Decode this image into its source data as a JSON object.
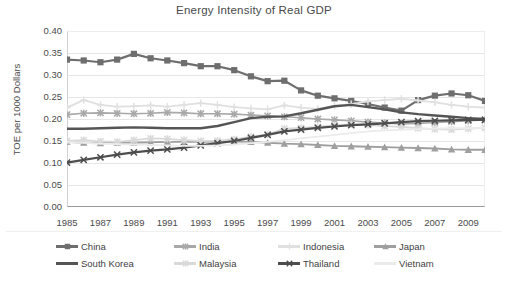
{
  "chart_data": {
    "type": "line",
    "title": "Energy Intensity of Real GDP",
    "xlabel": "",
    "ylabel": "TOE per 1000 Dollars",
    "ylim": [
      0.0,
      0.4
    ],
    "ytick_step": 0.05,
    "yticks": [
      "0.40",
      "0.35",
      "0.30",
      "0.25",
      "0.20",
      "0.15",
      "0.10",
      "0.05",
      "0.00"
    ],
    "grid": true,
    "legend_position": "bottom",
    "x": [
      1985,
      1986,
      1987,
      1988,
      1989,
      1990,
      1991,
      1992,
      1993,
      1994,
      1995,
      1996,
      1997,
      1998,
      1999,
      2000,
      2001,
      2002,
      2003,
      2004,
      2005,
      2006,
      2007,
      2008,
      2009,
      2010
    ],
    "xticks": [
      "1985",
      "1987",
      "1989",
      "1991",
      "1993",
      "1995",
      "1997",
      "1999",
      "2001",
      "2003",
      "2005",
      "2007",
      "2009"
    ],
    "xlim": [
      1985,
      2010
    ],
    "series": [
      {
        "name": "China",
        "color": "#6e6e6e",
        "marker": "square",
        "width": 2.2,
        "values": [
          0.335,
          0.333,
          0.329,
          0.335,
          0.348,
          0.338,
          0.333,
          0.327,
          0.32,
          0.32,
          0.311,
          0.297,
          0.286,
          0.287,
          0.265,
          0.253,
          0.247,
          0.241,
          0.234,
          0.226,
          0.219,
          0.243,
          0.253,
          0.258,
          0.254,
          0.241
        ]
      },
      {
        "name": "India",
        "color": "#a8a8a8",
        "marker": "cross",
        "width": 1.6,
        "values": [
          0.21,
          0.213,
          0.214,
          0.213,
          0.212,
          0.213,
          0.215,
          0.214,
          0.212,
          0.212,
          0.211,
          0.209,
          0.207,
          0.205,
          0.203,
          0.2,
          0.198,
          0.196,
          0.193,
          0.191,
          0.189,
          0.19,
          0.192,
          0.194,
          0.196,
          0.198
        ]
      },
      {
        "name": "Indonesia",
        "color": "#e0e0e0",
        "marker": "plus",
        "width": 1.8,
        "values": [
          0.226,
          0.243,
          0.232,
          0.228,
          0.229,
          0.231,
          0.228,
          0.232,
          0.236,
          0.232,
          0.227,
          0.224,
          0.222,
          0.231,
          0.226,
          0.223,
          0.23,
          0.234,
          0.24,
          0.243,
          0.246,
          0.242,
          0.238,
          0.232,
          0.228,
          0.226
        ]
      },
      {
        "name": "Japan",
        "color": "#9f9f9f",
        "marker": "triangle",
        "width": 1.9,
        "values": [
          0.148,
          0.146,
          0.145,
          0.146,
          0.146,
          0.147,
          0.148,
          0.148,
          0.148,
          0.149,
          0.149,
          0.148,
          0.146,
          0.144,
          0.143,
          0.141,
          0.139,
          0.138,
          0.137,
          0.136,
          0.135,
          0.134,
          0.133,
          0.131,
          0.13,
          0.13
        ]
      },
      {
        "name": "South Korea",
        "color": "#555555",
        "marker": "none",
        "width": 2.4,
        "values": [
          0.178,
          0.178,
          0.179,
          0.18,
          0.181,
          0.18,
          0.179,
          0.179,
          0.179,
          0.184,
          0.193,
          0.202,
          0.205,
          0.206,
          0.213,
          0.221,
          0.229,
          0.232,
          0.227,
          0.222,
          0.215,
          0.211,
          0.208,
          0.205,
          0.202,
          0.2
        ]
      },
      {
        "name": "Malaysia",
        "color": "#d9d9d9",
        "marker": "star",
        "width": 1.8,
        "values": [
          0.15,
          0.152,
          0.149,
          0.148,
          0.152,
          0.156,
          0.155,
          0.152,
          0.15,
          0.151,
          0.154,
          0.16,
          0.165,
          0.178,
          0.18,
          0.182,
          0.186,
          0.188,
          0.186,
          0.184,
          0.182,
          0.179,
          0.177,
          0.176,
          0.178,
          0.18
        ]
      },
      {
        "name": "Thailand",
        "color": "#4d4d4d",
        "marker": "x",
        "width": 2.2,
        "values": [
          0.101,
          0.107,
          0.113,
          0.119,
          0.124,
          0.128,
          0.131,
          0.135,
          0.14,
          0.145,
          0.15,
          0.157,
          0.164,
          0.172,
          0.176,
          0.18,
          0.183,
          0.186,
          0.188,
          0.19,
          0.193,
          0.195,
          0.196,
          0.197,
          0.198,
          0.198
        ]
      },
      {
        "name": "Vietnam",
        "color": "#ebebeb",
        "marker": "none",
        "width": 1.8,
        "values": [
          0.148,
          0.146,
          0.144,
          0.143,
          0.142,
          0.141,
          0.14,
          0.139,
          0.139,
          0.14,
          0.142,
          0.145,
          0.148,
          0.152,
          0.156,
          0.16,
          0.164,
          0.168,
          0.172,
          0.174,
          0.176,
          0.177,
          0.178,
          0.179,
          0.179,
          0.18
        ]
      }
    ]
  }
}
